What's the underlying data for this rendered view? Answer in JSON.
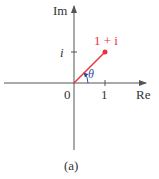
{
  "axes": {
    "x_label": "Re",
    "y_label": "Im",
    "origin_label": "0",
    "x_tick_label": "1",
    "y_tick_label": "i"
  },
  "point": {
    "label": "1 + i",
    "re": 1,
    "im": 1
  },
  "angle_label": "θ",
  "caption": "(a)",
  "colors": {
    "axis": "#555555",
    "vector": "#e8313a",
    "angle": "#2b4fa0",
    "text": "#333333"
  }
}
